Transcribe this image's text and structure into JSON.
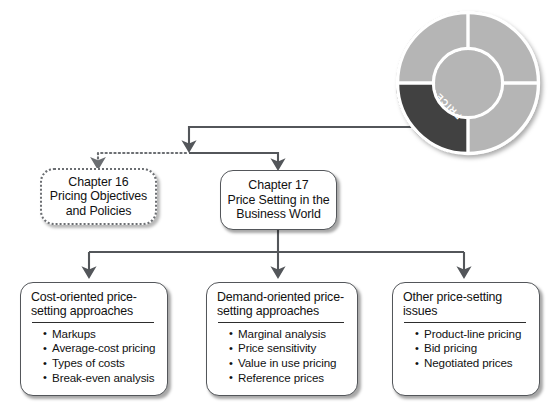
{
  "diagram": {
    "title": "Price Setting in the Business World",
    "wheel": {
      "label": "PRICE",
      "highlight_color": "#414141",
      "segment_color": "#b5b5b5",
      "hub_color": "#b5b5b5",
      "divider_color": "#ffffff",
      "segments": [
        "top-left",
        "top-right",
        "bottom-right",
        "bottom-left"
      ]
    },
    "line_color": "#53565a",
    "nodes": {
      "chapter16": {
        "lines": [
          "Chapter 16",
          "Pricing Objectives",
          "and Policies"
        ],
        "style": "dotted"
      },
      "chapter17": {
        "lines": [
          "Chapter 17",
          "Price Setting in the",
          "Business World"
        ],
        "style": "solid"
      },
      "cost_oriented": {
        "heading": [
          "Cost-oriented price-",
          "setting approaches"
        ],
        "items": [
          "Markups",
          "Average-cost pricing",
          "Types of costs",
          "Break-even analysis"
        ]
      },
      "demand_oriented": {
        "heading": [
          "Demand-oriented price-",
          "setting approaches"
        ],
        "items": [
          "Marginal analysis",
          "Price sensitivity",
          "Value in use pricing",
          "Reference prices"
        ]
      },
      "other_issues": {
        "heading": [
          "Other price-setting",
          "issues"
        ],
        "items": [
          "Product-line pricing",
          "Bid pricing",
          "Negotiated prices"
        ]
      }
    }
  }
}
